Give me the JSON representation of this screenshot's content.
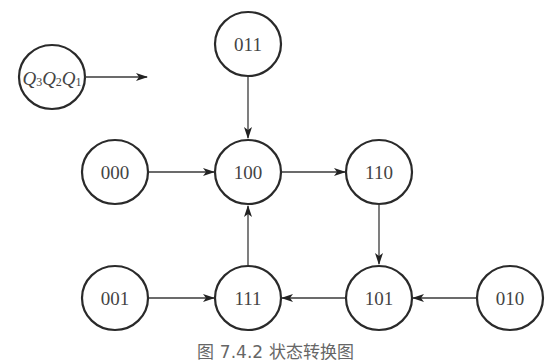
{
  "diagram": {
    "type": "state-transition",
    "legend": {
      "label": "Q3Q2Q1",
      "parts": [
        "Q",
        "3",
        "Q",
        "2",
        "Q",
        "1"
      ]
    },
    "nodes": [
      {
        "id": "011",
        "label": "011"
      },
      {
        "id": "000",
        "label": "000"
      },
      {
        "id": "100",
        "label": "100"
      },
      {
        "id": "110",
        "label": "110"
      },
      {
        "id": "001",
        "label": "001"
      },
      {
        "id": "111",
        "label": "111"
      },
      {
        "id": "101",
        "label": "101"
      },
      {
        "id": "010",
        "label": "010"
      }
    ],
    "edges": [
      {
        "from": "011",
        "to": "100"
      },
      {
        "from": "000",
        "to": "100"
      },
      {
        "from": "100",
        "to": "110"
      },
      {
        "from": "110",
        "to": "101"
      },
      {
        "from": "010",
        "to": "101"
      },
      {
        "from": "101",
        "to": "111"
      },
      {
        "from": "001",
        "to": "111"
      },
      {
        "from": "111",
        "to": "100"
      }
    ],
    "caption": "图 7.4.2   状态转换图"
  }
}
